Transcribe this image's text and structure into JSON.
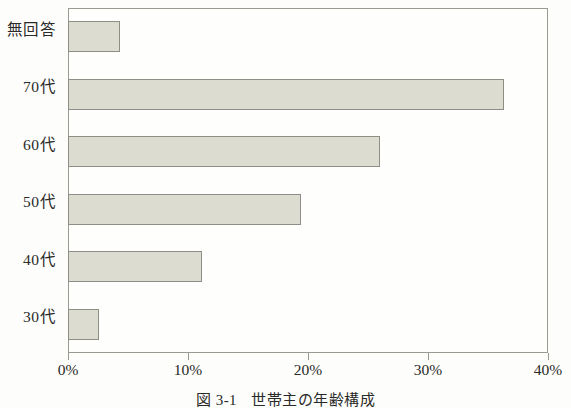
{
  "caption": {
    "number": "図 3-1",
    "title": "世帯主の年齢構成"
  },
  "axis": {
    "x_ticks": [
      "0%",
      "10%",
      "20%",
      "30%",
      "40%"
    ]
  },
  "chart_data": {
    "type": "bar",
    "orientation": "horizontal",
    "xlabel": "",
    "ylabel": "",
    "xlim": [
      0,
      40
    ],
    "xtick_labels": [
      "0%",
      "10%",
      "20%",
      "30%",
      "40%"
    ],
    "xtick_values": [
      0,
      10,
      20,
      30,
      40
    ],
    "grid": false,
    "legend": null,
    "bar_fill_color": "#dddcd1",
    "bar_border_color": "#8e8e86",
    "categories": [
      "30代",
      "40代",
      "50代",
      "60代",
      "70代",
      "無回答"
    ],
    "values": [
      2.6,
      11.2,
      19.4,
      26.0,
      36.3,
      4.3
    ],
    "unit": "%",
    "points": [
      {
        "category": "30代",
        "value": 2.6
      },
      {
        "category": "40代",
        "value": 11.2
      },
      {
        "category": "50代",
        "value": 19.4
      },
      {
        "category": "60代",
        "value": 26.0
      },
      {
        "category": "70代",
        "value": 36.3
      },
      {
        "category": "無回答",
        "value": 4.3
      }
    ],
    "category_order_top_to_bottom": [
      "無回答",
      "70代",
      "60代",
      "50代",
      "40代",
      "30代"
    ]
  }
}
